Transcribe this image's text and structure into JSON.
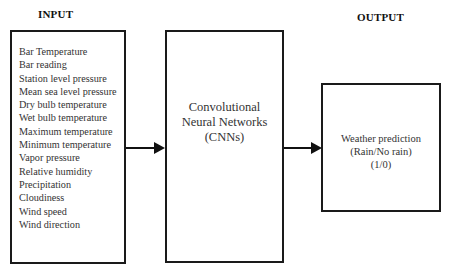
{
  "input": {
    "title": "INPUT",
    "items": [
      "Bar Temperature",
      "Bar reading",
      "Station level pressure",
      "Mean sea level pressure",
      "Dry bulb temperature",
      "Wet bulb temperature",
      "Maximum temperature",
      "Minimum temperature",
      "Vapor pressure",
      "Relative humidity",
      "Precipitation",
      "Cloudiness",
      "Wind speed",
      "Wind direction"
    ]
  },
  "model": {
    "lines": [
      "Convolutional",
      "Neural Networks",
      "(CNNs)"
    ]
  },
  "output": {
    "title": "OUTPUT",
    "lines": [
      "Weather prediction",
      "(Rain/No rain)",
      "(1/0)"
    ]
  }
}
